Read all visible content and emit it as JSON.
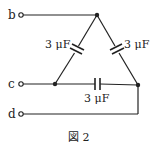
{
  "terminals": [
    {
      "id": "b",
      "label": "b"
    },
    {
      "id": "c",
      "label": "c"
    },
    {
      "id": "d",
      "label": "d"
    }
  ],
  "capacitors": [
    {
      "id": "left",
      "label": "3 μF"
    },
    {
      "id": "right",
      "label": "3 μF"
    },
    {
      "id": "bottom",
      "label": "3 μF"
    }
  ],
  "caption": "図 2",
  "colors": {
    "wire": "#222222",
    "background": "#ffffff"
  }
}
